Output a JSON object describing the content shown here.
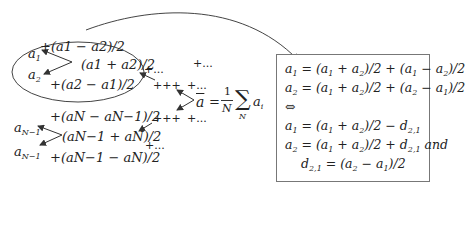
{
  "diagram": {
    "ellipse_group": {
      "top_term": "+(a1 − a2)/2",
      "a1_label": "a1",
      "a2_label": "a2",
      "mean_term": "(a1 + a2)/2",
      "bottom_term": "+(a2 − a1)/2"
    },
    "lower_group": {
      "top_term": "+(aN − aN−1)/2",
      "aN1_label": "aN−1",
      "aN_label": "aN−1",
      "mean_term": "(aN−1 + aN)/2",
      "bottom_term": "+(aN−1 − aN)/2"
    },
    "ellipsis_terms": [
      "+...",
      "+...",
      "+++",
      "+...",
      "+++",
      "+...",
      "+..."
    ],
    "mean_formula": {
      "lhs": "ā",
      "equals": "=",
      "fraction_num": "1",
      "fraction_den": "N",
      "sum_symbol": "∑",
      "sum_index": "N",
      "term": "a",
      "term_sub": "i"
    },
    "box": {
      "lines": [
        "a1 = (a1 + a2)/2 + (a1 − a2)/2",
        "a2 = (a1 + a2)/2 + (a2 − a1)/2",
        "⇔",
        "a1 = (a1 + a2)/2 − d2,1",
        "a2 = (a1 + a2)/2 + d2,1 and",
        "d2,1 = (a2 − a1)/2"
      ]
    }
  }
}
